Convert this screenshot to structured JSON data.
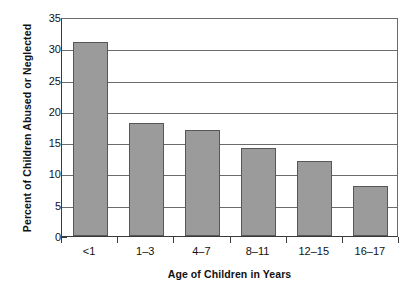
{
  "chart_data": {
    "type": "bar",
    "title": "",
    "subtitle": "",
    "xlabel": "Age of Children in Years",
    "ylabel": "Percent of Children Abused or Neglected",
    "categories": [
      "<1",
      "1–3",
      "4–7",
      "8–11",
      "12–15",
      "16–17"
    ],
    "values": [
      31,
      18,
      17,
      14,
      12,
      8
    ],
    "series": [
      {
        "name": "Percent of Children Abused or Neglected",
        "values": [
          31,
          18,
          17,
          14,
          12,
          8
        ]
      }
    ],
    "ylim": [
      0,
      35
    ],
    "yticks": [
      0,
      5,
      10,
      15,
      20,
      25,
      30,
      35
    ],
    "ytick_labels": [
      "0",
      "5",
      "10",
      "15",
      "20",
      "25",
      "30",
      "35"
    ],
    "grid": true,
    "grid_axis": "y",
    "legend": false,
    "legend_position": "none",
    "annotations": [],
    "colors": {
      "bar_fill": "#9b9b9b",
      "bar_stroke": "#575757",
      "axis": "#3a3a3a",
      "gridline": "#6b6b6b",
      "text": "#111111",
      "background": "#ffffff"
    }
  }
}
